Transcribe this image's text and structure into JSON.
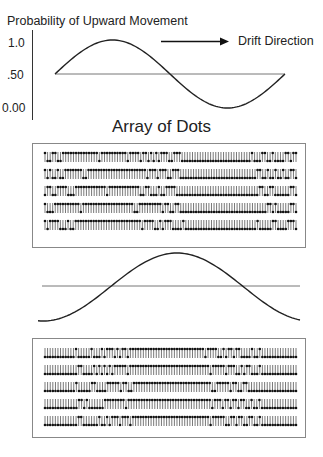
{
  "figure": {
    "y_axis_title": "Probability of Upward Movement",
    "y_ticks": [
      {
        "label": "1.0",
        "value": 1.0
      },
      {
        "label": ".50",
        "value": 0.5
      },
      {
        "label": "0.00",
        "value": 0.0
      }
    ],
    "drift_label": "Drift Direction",
    "drift_arrow": "right-arrow",
    "array_title": "Array of Dots",
    "colors": {
      "curve": "#222222",
      "baseline": "#777777",
      "box_border": "#888888",
      "ticks": "#333333",
      "dots": "#111111"
    },
    "curves": [
      {
        "name": "upper-probability-curve",
        "shape": "sine",
        "start": 0.5,
        "peak_at": 0.25,
        "trough_at": 0.75,
        "cycles": 1
      },
      {
        "name": "lower-probability-curve",
        "shape": "cosine-inverted",
        "start": 0.0,
        "peak_at": 0.5,
        "cycles": 1
      }
    ],
    "arrays": [
      {
        "name": "upper-dot-array",
        "rows": [
          "udduudduuuuuuuuuuuuuuduuuuuuuuuuduuuuduudududuuudduuuddddddddddddddddddddddddddduddduuddudddduuduu",
          "ududdudduuuuuuudduuuuuuuuuuuuuuuuuuuuuuuduuuduuudduuudddddddddddddddddddddddddddddduuddudduddudduud",
          "duudduuuuddduuuuuuuuuuuuduuuuuuuuuuuudduudddudduuuudddddddddddddddddddddddddddddddduudduudddddduud",
          "uddduuuuuuuuuuduuuuuuuuuuuuuuuuuuuudduuuuuuuuuduudduudddddddddddddddddddddddddddddddddduududdddduud",
          "uduuuudddudduuuuuuuuuuuuuuuuuuuuuuuuuuduuuudduduuuddddudddddddddddddddddddddddddddduddddduudddduuud"
        ]
      },
      {
        "name": "lower-dot-array",
        "rows": [
          "dddddddddddduddddduddduduuududuuduuuuuuuuuuuuuuuuuuuuuuuuuuuuuduuuudduduuduudddduddudddddddddddddd",
          "ddddddddddddduuddddududududuuuuuduuuuuuuuuuuuuuuuuuuuuuuuuuuuuuuduuuuuduuudduduudddudddddddddddddd",
          "dddddddddddduddddduudddduuuuuduudduuuuuuuuuuuuuuuuuuuuuuuuuuuuuudduuuuuduudduuddddddddddddddddddd",
          "ddddddddddddduududddddduuuuuuuuduuuuuuuuuuuuuuuuuuuuuuuuuuuuuuuuduuuduuduuduudduddudddddddddddddd",
          "ddddddddddddduuddddddudduduuuduuuduuuuuuuuuuuuuuuuuuuuuuuuuuuuuuduuuuudduuduudduuddudddddddddddddd"
        ]
      }
    ]
  }
}
